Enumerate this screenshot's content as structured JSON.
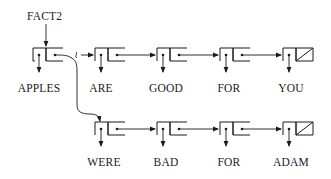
{
  "diagram": {
    "type": "linked-list cons-cell diagram",
    "pointer_label": "FACT2",
    "top_list": {
      "cells": [
        {
          "car": "APPLES",
          "cdr": "pointer"
        },
        {
          "car": "ARE",
          "cdr": "pointer"
        },
        {
          "car": "GOOD",
          "cdr": "pointer"
        },
        {
          "car": "FOR",
          "cdr": "pointer"
        },
        {
          "car": "YOU",
          "cdr": "nil"
        }
      ]
    },
    "bottom_list": {
      "cells": [
        {
          "car": "WERE",
          "cdr": "pointer"
        },
        {
          "car": "BAD",
          "cdr": "pointer"
        },
        {
          "car": "FOR",
          "cdr": "pointer"
        },
        {
          "car": "ADAM",
          "cdr": "nil"
        }
      ]
    }
  },
  "labels": {
    "fact2": "FACT2",
    "top": [
      "APPLES",
      "ARE",
      "GOOD",
      "FOR",
      "YOU"
    ],
    "bottom": [
      "WERE",
      "BAD",
      "FOR",
      "ADAM"
    ]
  }
}
